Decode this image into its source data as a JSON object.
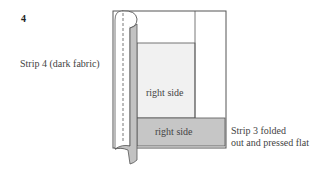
{
  "figure": {
    "step_number": "4",
    "labels": {
      "strip4": "Strip 4 (dark fabric)",
      "strip3_line1": "Strip 3 folded",
      "strip3_line2": "out and pressed flat",
      "inner_panel": "right side",
      "bottom_strip": "right side"
    },
    "colors": {
      "outline": "#555555",
      "dark_fabric": "#c2c2c2",
      "light_panel": "#f1f1f1",
      "bottom_strip": "#c6c6c6",
      "background": "#ffffff"
    }
  }
}
